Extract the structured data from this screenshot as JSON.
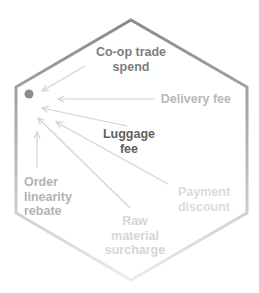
{
  "diagram": {
    "type": "hexagon-arrow-diagram",
    "hexagon": {
      "points": [
        [
          131,
          20
        ],
        [
          247,
          87
        ],
        [
          247,
          213
        ],
        [
          131,
          280
        ],
        [
          16,
          213
        ],
        [
          16,
          87
        ]
      ],
      "stroke_top": "#8a8a8a",
      "stroke_bottom": "#ececec",
      "stroke_width": 3
    },
    "target_dot": {
      "cx": 29,
      "cy": 94,
      "r": 4.5,
      "color": "#8c8c8c"
    },
    "arrow_color": "#d2d2d2",
    "labels": [
      {
        "id": "coop",
        "lines": [
          "Co-op trade",
          "spend"
        ],
        "x": 131,
        "y": 56,
        "anchor": "middle",
        "color": "#7d7d7d",
        "arrow": {
          "x1": 85,
          "y1": 66,
          "x2": 42,
          "y2": 91
        }
      },
      {
        "id": "delivery",
        "lines": [
          "Delivery fee"
        ],
        "x": 231,
        "y": 103,
        "anchor": "end",
        "color": "#b8b8b8",
        "arrow": {
          "x1": 155,
          "y1": 99,
          "x2": 58,
          "y2": 99
        }
      },
      {
        "id": "luggage",
        "lines": [
          "Luggage",
          "fee"
        ],
        "x": 129,
        "y": 138,
        "anchor": "middle",
        "color": "#5f5f5f",
        "arrow": {
          "x1": 127,
          "y1": 126,
          "x2": 42,
          "y2": 108
        }
      },
      {
        "id": "payment",
        "lines": [
          "Payment",
          "discount"
        ],
        "x": 204,
        "y": 196,
        "anchor": "middle",
        "color": "#dcdcdc",
        "arrow": {
          "x1": 168,
          "y1": 184,
          "x2": 56,
          "y2": 122
        }
      },
      {
        "id": "raw",
        "lines": [
          "Raw",
          "material",
          "surcharge"
        ],
        "x": 135,
        "y": 225,
        "anchor": "middle",
        "color": "#d6d6d6",
        "arrow": {
          "x1": 130,
          "y1": 208,
          "x2": 38,
          "y2": 118
        }
      },
      {
        "id": "order",
        "lines": [
          "Order",
          "linearity",
          "rebate"
        ],
        "x": 24,
        "y": 186,
        "anchor": "start",
        "color": "#b2b2b2",
        "arrow": {
          "x1": 37,
          "y1": 168,
          "x2": 37,
          "y2": 132
        }
      }
    ]
  }
}
